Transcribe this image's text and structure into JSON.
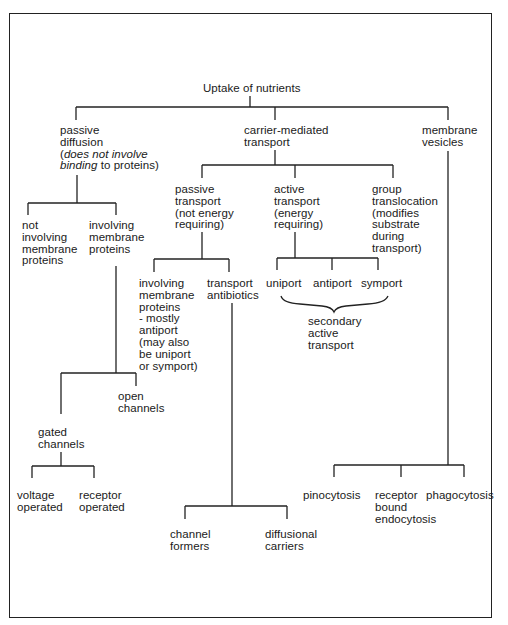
{
  "diagram": {
    "root": {
      "label": "Uptake of nutrients"
    },
    "passive_diffusion": {
      "line1": "passive",
      "line2": "diffusion",
      "line3_pre": "(",
      "line3_italic": "does not involve",
      "line4_italic": "binding",
      "line4_post": " to proteins)"
    },
    "carrier_mediated": {
      "label": "carrier-mediated\ntransport"
    },
    "membrane_vesicles": {
      "label": "membrane\nvesicles"
    },
    "not_involving": {
      "label": "not\ninvolving\nmembrane\nproteins"
    },
    "involving": {
      "label": "involving\nmembrane\nproteins"
    },
    "passive_transport": {
      "label": "passive\ntransport\n(not energy\nrequiring)"
    },
    "active_transport": {
      "label": "active\ntransport\n(energy\nrequiring)"
    },
    "group_translocation": {
      "label": "group\ntranslocation\n(modifies\nsubstrate\nduring\ntransport)"
    },
    "involving_mostly_antiport": {
      "label": "involving\nmembrane\nproteins\n- mostly\nantiport\n(may also\nbe uniport\nor symport)"
    },
    "transport_antibiotics": {
      "label": "transport\nantibiotics"
    },
    "uniport": {
      "label": "uniport"
    },
    "antiport": {
      "label": "antiport"
    },
    "symport": {
      "label": "symport"
    },
    "secondary_active": {
      "label": "secondary\nactive\ntransport"
    },
    "open_channels": {
      "label": "open\nchannels"
    },
    "gated_channels": {
      "label": "gated\nchannels"
    },
    "voltage_operated": {
      "label": "voltage\noperated"
    },
    "receptor_operated": {
      "label": "receptor\noperated"
    },
    "channel_formers": {
      "label": "channel\nformers"
    },
    "diffusional_carriers": {
      "label": "diffusional\ncarriers"
    },
    "pinocytosis": {
      "label": "pinocytosis"
    },
    "receptor_bound_endocytosis": {
      "label": "receptor\nbound\nendocytosis"
    },
    "phagocytosis": {
      "label": "phagocytosis"
    }
  }
}
